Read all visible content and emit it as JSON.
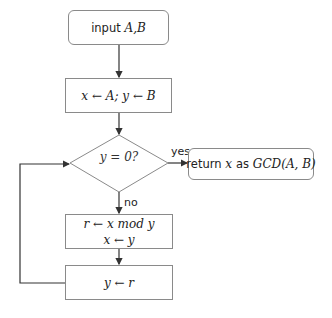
{
  "nodes": {
    "input": {
      "prefix": "input",
      "math": "A,B"
    },
    "init": {
      "math": "x ← A; y ← B"
    },
    "decision": {
      "math": "y = 0?"
    },
    "return": {
      "prefix": "return",
      "var": "x",
      "mid": "as",
      "math": "GCD(A, B)"
    },
    "step1": {
      "line1": "r ← x  mod y",
      "line2": "x ← y"
    },
    "step2": {
      "math": "y ← r"
    }
  },
  "edges": {
    "yes_label": "yes",
    "no_label": "no"
  },
  "colors": {
    "stroke": "#8a8a8a",
    "arrow": "#333333"
  }
}
